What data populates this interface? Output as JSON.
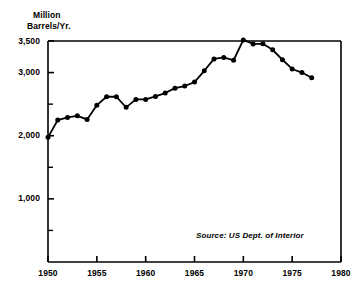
{
  "chart_data": {
    "type": "line",
    "title": "",
    "subtitle": "",
    "ylabel_line1": "Million",
    "ylabel_line2": "Barrels/Yr.",
    "xlabel": "",
    "ylabel": "Million Barrels/Yr.",
    "annotation": "Source: US Dept. of Interior",
    "grid": false,
    "legend": "none",
    "xlim": [
      1950,
      1980
    ],
    "ylim": [
      0,
      3500
    ],
    "ytick_values": [
      3500,
      3000,
      2000,
      1000
    ],
    "ytick_labels": [
      "3,500",
      "3,000",
      "2,000",
      "1,000"
    ],
    "yminor_tick_values": [
      2500,
      1500,
      500
    ],
    "xtick_values": [
      1950,
      1955,
      1960,
      1965,
      1970,
      1975,
      1980
    ],
    "xtick_labels": [
      "1950",
      "1955",
      "1960",
      "1965",
      "1970",
      "1975",
      "1980"
    ],
    "series": [
      {
        "name": "US Crude Oil Production",
        "marker": "filled-circle",
        "color": "#000000",
        "x": [
          1950,
          1951,
          1952,
          1953,
          1954,
          1955,
          1956,
          1957,
          1958,
          1959,
          1960,
          1961,
          1962,
          1963,
          1964,
          1965,
          1966,
          1967,
          1968,
          1969,
          1970,
          1971,
          1972,
          1973,
          1974,
          1975,
          1976,
          1977
        ],
        "values": [
          1974,
          2248,
          2289,
          2315,
          2258,
          2484,
          2617,
          2617,
          2449,
          2575,
          2575,
          2622,
          2676,
          2753,
          2787,
          2849,
          3028,
          3216,
          3239,
          3195,
          3517,
          3454,
          3455,
          3361,
          3203,
          3057,
          3000,
          2918
        ]
      }
    ]
  }
}
